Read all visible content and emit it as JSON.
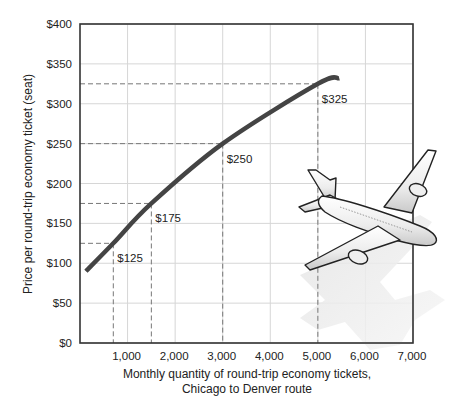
{
  "chart_data": {
    "type": "line",
    "title": "",
    "xlabel": "Monthly quantity of round-trip economy tickets,",
    "xlabel_line2": "Chicago to Denver route",
    "ylabel": "Price per round-trip economy ticket (seat)",
    "xlim": [
      0,
      7000
    ],
    "ylim": [
      0,
      400
    ],
    "x_ticks": [
      1000,
      2000,
      3000,
      4000,
      5000,
      6000,
      7000
    ],
    "x_tick_labels": [
      "1,000",
      "2,000",
      "3,000",
      "4,000",
      "5,000",
      "6,000",
      "7,000"
    ],
    "y_ticks": [
      0,
      50,
      100,
      150,
      200,
      250,
      300,
      350,
      400
    ],
    "y_tick_labels": [
      "$0",
      "$50",
      "$100",
      "$150",
      "$200",
      "$250",
      "$300",
      "$350",
      "$400"
    ],
    "grid": true,
    "legend": null,
    "series": [
      {
        "name": "Demand curve",
        "color": "#444444",
        "x": [
          125,
          700,
          1500,
          3000,
          5000,
          5450
        ],
        "y": [
          90,
          125,
          175,
          250,
          325,
          332
        ]
      }
    ],
    "annotations": [
      {
        "label": "$125",
        "x": 700,
        "y": 125
      },
      {
        "label": "$175",
        "x": 1500,
        "y": 175
      },
      {
        "label": "$250",
        "x": 3000,
        "y": 250
      },
      {
        "label": "$325",
        "x": 5000,
        "y": 325
      }
    ],
    "decoration": "airplane illustration with shadow"
  },
  "colors": {
    "curve": "#444444",
    "grid": "#d6d6d6",
    "axis": "#333333",
    "dash": "#777777"
  }
}
